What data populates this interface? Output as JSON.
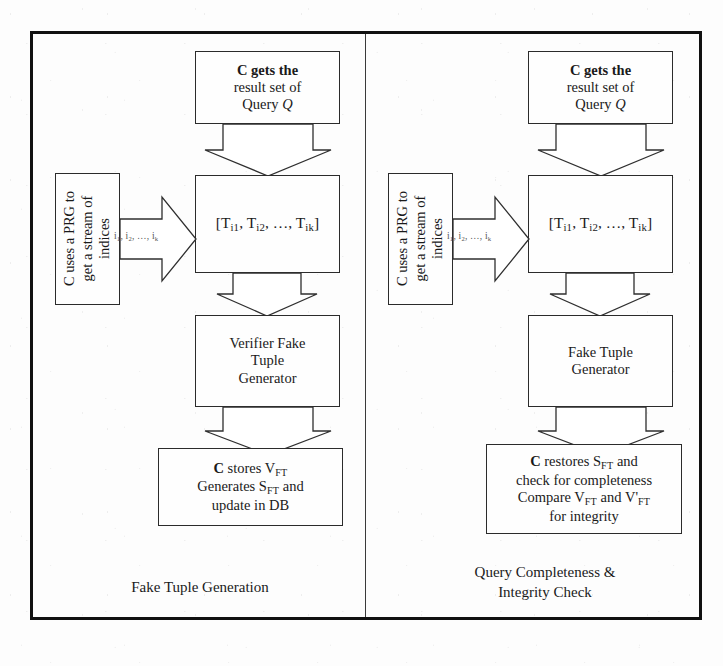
{
  "figure": {
    "background_color": "#fdfdfd",
    "frame_color": "#111111",
    "box_border_color": "#2b2b2b"
  },
  "panels": [
    {
      "id": "left",
      "caption": "Fake Tuple Generation",
      "nodes": {
        "result_set": {
          "line1": "C gets the",
          "line2": "result set of",
          "line3_prefix": "Query ",
          "line3_italic": "Q"
        },
        "prg": {
          "line1": "C uses a PRG to",
          "line2": "get a stream of",
          "line3": "indices"
        },
        "tuples": {
          "open": "[T",
          "sub1": "i1",
          "sep1": ", T",
          "sub2": "i2",
          "sep2": ", …, T",
          "sub3": "ik",
          "close": "]"
        },
        "generator": {
          "line1": "Verifier Fake",
          "line2": "Tuple",
          "line3": "Generator"
        },
        "store": {
          "l1_a": "C",
          "l1_b": " stores V",
          "l1_sub": "FT",
          "l2_a": "Generates S",
          "l2_sub": "FT",
          "l2_b": " and",
          "l3": "update in DB"
        }
      },
      "edges": {
        "result_to_tuples": {
          "label_base": "R",
          "label_sub": "Q"
        },
        "prg_to_tuples": {
          "i1": "i",
          "i1s": "1",
          "i2": ", i",
          "i2s": "2",
          "ik": ", …, i",
          "iks": "k"
        },
        "generator_to_store": {
          "label_base": "V",
          "label_sub": "FT"
        }
      }
    },
    {
      "id": "right",
      "caption": "Query Completeness &\nIntegrity Check",
      "nodes": {
        "result_set": {
          "line1": "C gets the",
          "line2": "result set of",
          "line3_prefix": "Query ",
          "line3_italic": "Q"
        },
        "prg": {
          "line1": "C uses a PRG to",
          "line2": "get a stream of",
          "line3": "indices"
        },
        "tuples": {
          "open": "[T",
          "sub1": "i1",
          "sep1": ", T",
          "sub2": "i2",
          "sep2": ", …, T",
          "sub3": "ik",
          "close": "]"
        },
        "generator": {
          "line1": "Fake Tuple",
          "line2": "Generator"
        },
        "check": {
          "l1_a": "C",
          "l1_b": " restores S",
          "l1_sub": "FT",
          "l1_c": " and",
          "l2": "check for completeness",
          "l3_a": "Compare V",
          "l3_sub1": "FT",
          "l3_b": " and V'",
          "l3_sub2": "FT",
          "l4": "for integrity"
        }
      },
      "edges": {
        "result_to_tuples": {
          "label_base": "R",
          "label_sub": "Q"
        },
        "prg_to_tuples": {
          "i1": "i",
          "i1s": "1",
          "i2": ", i",
          "i2s": "2",
          "ik": ", …, i",
          "iks": "k"
        },
        "generator_to_check": {
          "label_base": "V'",
          "label_sub": "FT"
        }
      }
    }
  ]
}
